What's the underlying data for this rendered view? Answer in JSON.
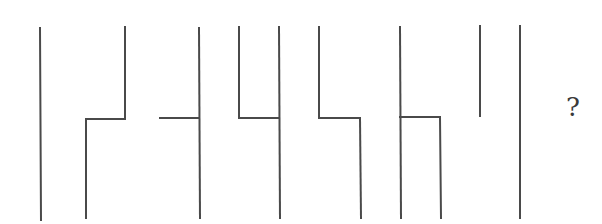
{
  "puzzle": {
    "description": "Sequence of line figures; find the next figure",
    "stroke_color": "#4a4a4a",
    "question_mark": "?",
    "figures": [
      {
        "index": 1,
        "segments": [
          [
            40,
            28,
            41,
            220
          ]
        ]
      },
      {
        "index": 2,
        "segments": [
          [
            125,
            27,
            125,
            119
          ],
          [
            86,
            119,
            125,
            119
          ],
          [
            86,
            119,
            86,
            218
          ]
        ]
      },
      {
        "index": 3,
        "segments": [
          [
            199,
            28,
            200,
            218
          ],
          [
            160,
            118,
            199,
            118
          ]
        ]
      },
      {
        "index": 4,
        "segments": [
          [
            239,
            27,
            239,
            118
          ],
          [
            239,
            118,
            279,
            118
          ],
          [
            279,
            27,
            280,
            218
          ]
        ]
      },
      {
        "index": 5,
        "segments": [
          [
            319,
            27,
            319,
            118
          ],
          [
            319,
            118,
            360,
            118
          ],
          [
            360,
            118,
            361,
            218
          ]
        ]
      },
      {
        "index": 6,
        "segments": [
          [
            400,
            27,
            401,
            218
          ],
          [
            400,
            117,
            440,
            117
          ],
          [
            440,
            117,
            441,
            218
          ]
        ]
      },
      {
        "index": 7,
        "segments": [
          [
            480,
            26,
            480,
            116
          ],
          [
            520,
            26,
            520,
            218
          ]
        ]
      }
    ]
  }
}
